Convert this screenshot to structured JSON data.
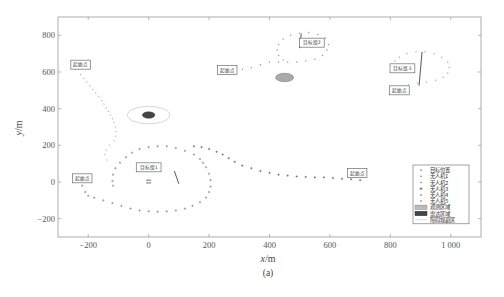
{
  "chart_data": {
    "type": "scatter",
    "title": "",
    "caption": "(a)",
    "xlabel": "x/m",
    "ylabel": "y/m",
    "xlim": [
      -300,
      1100
    ],
    "ylim": [
      -300,
      900
    ],
    "xticks": [
      -200,
      0,
      200,
      400,
      600,
      800,
      1000
    ],
    "xtick_labels": [
      "−200",
      "0",
      "200",
      "400",
      "600",
      "800",
      "1 000"
    ],
    "yticks": [
      -200,
      0,
      200,
      400,
      600,
      800
    ],
    "ytick_labels": [
      "−200",
      "0",
      "200",
      "400",
      "600",
      "800"
    ],
    "grid": false,
    "legend_position": "lower right",
    "legend": [
      {
        "label": "目标位置",
        "marker": "dot"
      },
      {
        "label": "无人机1",
        "marker": "dot"
      },
      {
        "label": "无人机2",
        "marker": "dot"
      },
      {
        "label": "无人机3",
        "marker": "star"
      },
      {
        "label": "无人机4",
        "marker": "dot"
      },
      {
        "label": "无人机5",
        "marker": "dot"
      },
      {
        "label": "观测区域",
        "marker": "light-patch"
      },
      {
        "label": "雷达区域",
        "marker": "dark-patch"
      },
      {
        "label": "障碍规避区",
        "marker": "line"
      }
    ],
    "annotations": [
      {
        "text": "起始点",
        "x": -225,
        "y": 640
      },
      {
        "text": "起始点",
        "x": -220,
        "y": 20
      },
      {
        "text": "起始点",
        "x": 260,
        "y": 610
      },
      {
        "text": "起始点",
        "x": 690,
        "y": 50
      },
      {
        "text": "起始点",
        "x": 830,
        "y": 500
      },
      {
        "text": "目标组1",
        "x": 0,
        "y": 80
      },
      {
        "text": "目标组2",
        "x": 540,
        "y": 760
      },
      {
        "text": "目标组3",
        "x": 840,
        "y": 620
      }
    ],
    "obstacles": [
      {
        "type": "radar",
        "cx": 0,
        "cy": 365,
        "rx": 18,
        "ry": 16,
        "ring_rx": 70,
        "ring_ry": 48,
        "color": "#444444"
      },
      {
        "type": "observation",
        "cx": 450,
        "cy": 570,
        "rx": 30,
        "ry": 22,
        "color": "#aaaaaa"
      }
    ],
    "targets": [
      {
        "name": "target-group-1",
        "points": [
          [
            0,
            -5
          ],
          [
            0,
            10
          ]
        ],
        "heading_line": [
          [
            85,
            60
          ],
          [
            100,
            -10
          ]
        ]
      },
      {
        "name": "target-group-2",
        "heading_line": [
          [
            500,
            730
          ],
          [
            505,
            810
          ]
        ]
      },
      {
        "name": "target-group-3",
        "heading_line": [
          [
            895,
            525
          ],
          [
            905,
            710
          ]
        ]
      }
    ],
    "series": [
      {
        "name": "无人机1",
        "color": "#bbbbbb",
        "marker": "dot",
        "points": [
          [
            -225,
            585
          ],
          [
            -215,
            565
          ],
          [
            -205,
            545
          ],
          [
            -195,
            525
          ],
          [
            -185,
            505
          ],
          [
            -175,
            485
          ],
          [
            -165,
            465
          ],
          [
            -155,
            445
          ],
          [
            -148,
            425
          ],
          [
            -140,
            405
          ],
          [
            -133,
            385
          ],
          [
            -126,
            365
          ],
          [
            -120,
            345
          ],
          [
            -115,
            325
          ],
          [
            -110,
            300
          ],
          [
            -108,
            275
          ],
          [
            -110,
            250
          ],
          [
            -115,
            225
          ],
          [
            -130,
            200
          ],
          [
            -140,
            175
          ],
          [
            -145,
            150
          ],
          [
            -138,
            120
          ]
        ]
      },
      {
        "name": "无人机2",
        "color": "#888888",
        "marker": "star",
        "points": [
          [
            -220,
            -20
          ],
          [
            -210,
            -55
          ],
          [
            -200,
            -75
          ],
          [
            -180,
            -85
          ],
          [
            -150,
            -100
          ],
          [
            -120,
            -115
          ],
          [
            -90,
            -130
          ],
          [
            -60,
            -145
          ],
          [
            -30,
            -155
          ],
          [
            0,
            -160
          ],
          [
            30,
            -162
          ],
          [
            60,
            -160
          ],
          [
            90,
            -155
          ],
          [
            120,
            -145
          ],
          [
            145,
            -130
          ],
          [
            170,
            -110
          ],
          [
            190,
            -85
          ],
          [
            200,
            -55
          ],
          [
            205,
            -25
          ],
          [
            205,
            10
          ],
          [
            200,
            45
          ],
          [
            190,
            80
          ],
          [
            180,
            105
          ],
          [
            170,
            125
          ],
          [
            150,
            150
          ],
          [
            120,
            170
          ],
          [
            90,
            185
          ],
          [
            60,
            195
          ],
          [
            30,
            195
          ],
          [
            0,
            190
          ],
          [
            -30,
            180
          ],
          [
            -55,
            160
          ],
          [
            -75,
            135
          ],
          [
            -95,
            105
          ],
          [
            -110,
            75
          ],
          [
            -118,
            40
          ],
          [
            -120,
            5
          ],
          [
            -118,
            -20
          ]
        ]
      },
      {
        "name": "无人机3",
        "color": "#666666",
        "marker": "star",
        "points": [
          [
            700,
            10
          ],
          [
            670,
            15
          ],
          [
            640,
            18
          ],
          [
            610,
            22
          ],
          [
            580,
            25
          ],
          [
            550,
            25
          ],
          [
            520,
            28
          ],
          [
            490,
            30
          ],
          [
            460,
            35
          ],
          [
            430,
            40
          ],
          [
            400,
            50
          ],
          [
            370,
            60
          ],
          [
            340,
            75
          ],
          [
            310,
            90
          ],
          [
            285,
            110
          ],
          [
            265,
            130
          ],
          [
            245,
            150
          ],
          [
            225,
            165
          ],
          [
            200,
            180
          ],
          [
            175,
            190
          ],
          [
            150,
            195
          ]
        ]
      },
      {
        "name": "无人机4",
        "color": "#999999",
        "marker": "dot",
        "points": [
          [
            280,
            605
          ],
          [
            310,
            615
          ],
          [
            340,
            625
          ],
          [
            370,
            640
          ],
          [
            400,
            655
          ],
          [
            430,
            655
          ],
          [
            460,
            655
          ],
          [
            490,
            655
          ],
          [
            520,
            660
          ],
          [
            550,
            670
          ],
          [
            575,
            690
          ],
          [
            590,
            720
          ],
          [
            595,
            750
          ],
          [
            585,
            785
          ],
          [
            560,
            805
          ],
          [
            530,
            815
          ],
          [
            500,
            812
          ],
          [
            470,
            800
          ],
          [
            445,
            780
          ],
          [
            430,
            750
          ],
          [
            425,
            720
          ],
          [
            430,
            690
          ],
          [
            445,
            665
          ]
        ]
      },
      {
        "name": "无人机5",
        "color": "#aaaaaa",
        "marker": "dot",
        "points": [
          [
            830,
            520
          ],
          [
            860,
            530
          ],
          [
            890,
            540
          ],
          [
            920,
            545
          ],
          [
            950,
            555
          ],
          [
            975,
            570
          ],
          [
            990,
            595
          ],
          [
            995,
            625
          ],
          [
            990,
            655
          ],
          [
            970,
            680
          ],
          [
            945,
            700
          ],
          [
            915,
            710
          ],
          [
            885,
            710
          ],
          [
            855,
            700
          ],
          [
            830,
            680
          ],
          [
            815,
            660
          ],
          [
            810,
            630
          ],
          [
            815,
            605
          ]
        ]
      }
    ]
  },
  "figure": {
    "caption": "(a)",
    "xlabel_var": "x",
    "xlabel_unit": "/m",
    "ylabel_var": "y",
    "ylabel_unit": "/m"
  }
}
